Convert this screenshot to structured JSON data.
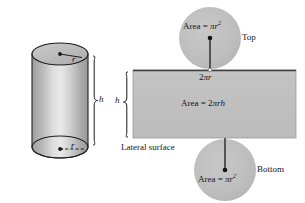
{
  "figure": {
    "background_color": "#ffffff",
    "fill_color": "#bfbfbf",
    "outline_color": "#1a1a1a",
    "text_color": "#151515"
  },
  "cylinder": {
    "name": "cylinder",
    "top_radius_label": "r",
    "bottom_radius_label": "r",
    "height_label": "h"
  },
  "net": {
    "top_circle": {
      "area_prefix": "Area = ",
      "area_pi": "π",
      "area_var": "r",
      "area_exponent": "2",
      "caption": "Top"
    },
    "bottom_circle": {
      "area_prefix": "Area = ",
      "area_pi": "π",
      "area_var": "r",
      "area_exponent": "2",
      "caption": "Bottom"
    },
    "rectangle": {
      "area_prefix": "Area = 2",
      "area_pi": "π",
      "area_vars": "rh",
      "width_label_prefix": "2",
      "width_label_pi": "π",
      "width_label_var": "r",
      "height_label": "h",
      "caption": "Lateral surface"
    }
  }
}
